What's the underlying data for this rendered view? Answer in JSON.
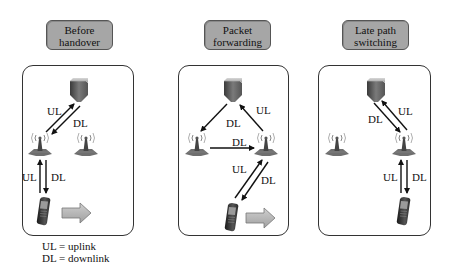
{
  "panels": [
    {
      "title_line1": "Before",
      "title_line2": "handover",
      "labels": {
        "ul_core": "UL",
        "dl_core": "DL",
        "ul_radio": "UL",
        "dl_radio": "DL"
      }
    },
    {
      "title_line1": "Packet",
      "title_line2": "forwarding",
      "labels": {
        "dl_core": "DL",
        "ul_core": "UL",
        "dl_forward": "DL",
        "ul_radio": "UL",
        "dl_radio": "DL"
      }
    },
    {
      "title_line1": "Late path",
      "title_line2": "switching",
      "labels": {
        "dl_core": "DL",
        "ul_core": "UL",
        "ul_radio": "UL",
        "dl_radio": "DL"
      }
    }
  ],
  "legend": {
    "line1": "UL = uplink",
    "line2": "DL = downlink"
  },
  "icons": {
    "core": "server-icon",
    "base_station": "antenna-tower-icon",
    "terminal": "mobile-phone-icon",
    "movement": "right-block-arrow-icon"
  },
  "colors": {
    "title_fill": "#a6a6a6",
    "arrow": "#111111",
    "move_arrow_fill": "#b0b0b0"
  }
}
